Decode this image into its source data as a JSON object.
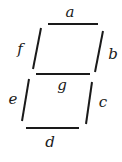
{
  "diagram": {
    "stroke_color": "#1a1a1a",
    "background": "#ffffff",
    "segments": [
      {
        "id": "a",
        "label": "a",
        "x1": 48,
        "y1": 24,
        "x2": 98,
        "y2": 24,
        "lx": 70,
        "ly": 13
      },
      {
        "id": "b",
        "label": "b",
        "x1": 103,
        "y1": 31,
        "x2": 95,
        "y2": 72,
        "lx": 113,
        "ly": 55
      },
      {
        "id": "c",
        "label": "c",
        "x1": 92,
        "y1": 82,
        "x2": 86,
        "y2": 124,
        "lx": 103,
        "ly": 103
      },
      {
        "id": "d",
        "label": "d",
        "x1": 26,
        "y1": 128,
        "x2": 79,
        "y2": 128,
        "lx": 50,
        "ly": 143
      },
      {
        "id": "e",
        "label": "e",
        "x1": 29,
        "y1": 79,
        "x2": 22,
        "y2": 121,
        "lx": 13,
        "ly": 100
      },
      {
        "id": "f",
        "label": "f",
        "x1": 41,
        "y1": 28,
        "x2": 33,
        "y2": 69,
        "lx": 20,
        "ly": 50
      },
      {
        "id": "g",
        "label": "g",
        "x1": 36,
        "y1": 74,
        "x2": 90,
        "y2": 74,
        "lx": 62,
        "ly": 86
      }
    ]
  }
}
